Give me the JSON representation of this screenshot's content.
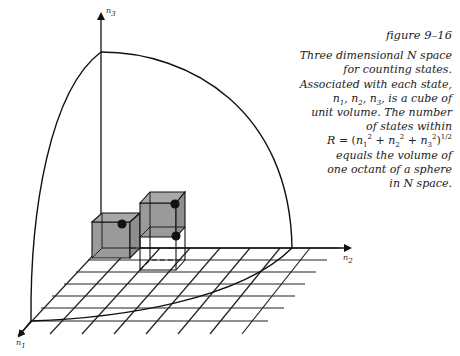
{
  "caption": {
    "title": "figure 9–16",
    "lines": [
      "Three dimensional N space",
      "for counting states.",
      "Associated with each state,",
      "n1, n2, n3, is a cube of",
      "unit volume. The number",
      "of states within",
      "R = (n1² + n2² + n3²)^1/2",
      "equals the volume of",
      "one octant of a sphere",
      "in N space."
    ]
  },
  "axes": {
    "n1": "n1",
    "n2": "n2",
    "n3": "n3"
  },
  "colors": {
    "line": "#111111",
    "cube_fill": "#9a9a9a",
    "dot": "#111111"
  }
}
